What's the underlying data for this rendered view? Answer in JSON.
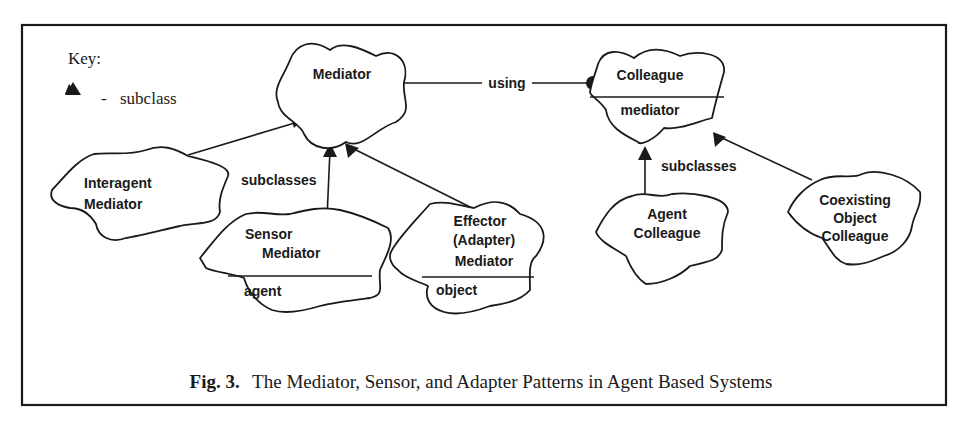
{
  "figure": {
    "caption_label": "Fig. 3.",
    "caption_text": "The Mediator, Sensor, and Adapter Patterns in Agent Based Systems"
  },
  "key": {
    "title": "Key:",
    "symbol": "filled-triangle-icon",
    "dash": "-",
    "meaning": "subclass"
  },
  "nodes": {
    "mediator": {
      "name": "Mediator"
    },
    "colleague": {
      "name": "Colleague",
      "attribute": "mediator"
    },
    "interagent_mediator": {
      "line1": "Interagent",
      "line2": "Mediator"
    },
    "sensor_mediator": {
      "line1": "Sensor",
      "line2": "Mediator",
      "attribute": "agent"
    },
    "effector_mediator": {
      "line1": "Effector",
      "line2": "(Adapter)",
      "line3": "Mediator",
      "attribute": "object"
    },
    "agent_colleague": {
      "line1": "Agent",
      "line2": "Colleague"
    },
    "coexisting_object_colleague": {
      "line1": "Coexisting",
      "line2": "Object",
      "line3": "Colleague"
    }
  },
  "edges": {
    "using_label": "using",
    "mediator_subclasses_label": "subclasses",
    "colleague_subclasses_label": "subclasses"
  },
  "colors": {
    "ink": "#1a1a1a",
    "background": "#ffffff"
  }
}
